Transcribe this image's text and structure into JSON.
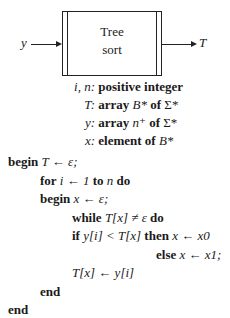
{
  "diagram": {
    "box_label_line1": "Tree",
    "box_label_line2": "sort",
    "input_label": "y",
    "output_label": "T"
  },
  "declarations": [
    {
      "vars": "i, n:",
      "desc": "positive integer"
    },
    {
      "vars": "T:",
      "desc_parts": [
        "array ",
        "B*",
        " of ",
        "Σ*"
      ]
    },
    {
      "vars": "y:",
      "desc_parts": [
        "array ",
        "n⁺",
        " of ",
        "Σ*"
      ]
    },
    {
      "vars": "x:",
      "desc_parts": [
        "element of ",
        "B*"
      ]
    }
  ],
  "code": {
    "line1": {
      "kw": "begin",
      "rest": " T ← ε;"
    },
    "line2": {
      "kw1": "for",
      "mid1": " i ← 1 ",
      "kw2": "to",
      "mid2": " n ",
      "kw3": "do"
    },
    "line3": {
      "kw": "begin",
      "rest": " x ← ε;"
    },
    "line4": {
      "kw1": "while",
      "mid": " T[x] ≠ ε ",
      "kw2": "do"
    },
    "line5": {
      "kw1": "if",
      "mid1": " y[i] < T[x] ",
      "kw2": "then",
      "mid2": " x ← x0"
    },
    "line6": {
      "kw": "else",
      "rest": " x ← x1;"
    },
    "line7": {
      "rest": "T[x] ← y[i]"
    },
    "line8": {
      "kw": "end"
    },
    "line9": {
      "kw": "end"
    }
  }
}
